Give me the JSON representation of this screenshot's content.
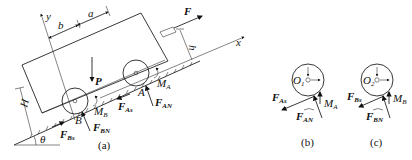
{
  "figure": {
    "panels": [
      {
        "id": "a",
        "caption": "(a)"
      },
      {
        "id": "b",
        "caption": "(b)"
      },
      {
        "id": "c",
        "caption": "(c)"
      }
    ]
  },
  "labels": {
    "axis_x": "x",
    "axis_y": "y",
    "dim_a": "a",
    "dim_b": "b",
    "dim_h": "h",
    "dim_H": "H",
    "angle": "θ",
    "force_F": "F",
    "weight_P": "P",
    "point_A": "A",
    "point_B": "B",
    "M_A": "M",
    "M_A_sub": "A",
    "M_B": "M",
    "M_B_sub": "B",
    "F_As": "F",
    "F_As_sub": "As",
    "F_AN": "F",
    "F_AN_sub": "AN",
    "F_Bs": "F",
    "F_Bs_sub": "Bs",
    "F_BN": "F",
    "F_BN_sub": "BN",
    "O1": "O",
    "O1_sub": "1",
    "O2": "O",
    "O2_sub": "2"
  }
}
